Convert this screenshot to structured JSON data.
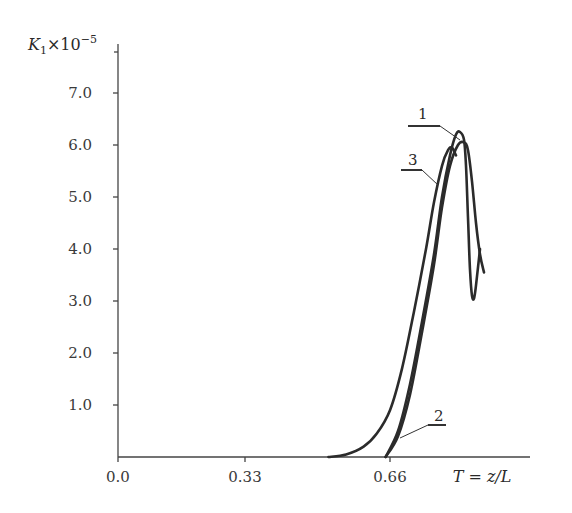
{
  "chart_data": {
    "type": "line",
    "title": "",
    "xlabel": "T = z/L",
    "ylabel": "K1×10^-5",
    "ylabel_parts": {
      "base": "K",
      "sub": "1",
      "mult": "×10",
      "sup": "−5"
    },
    "xlim": [
      0.0,
      0.99
    ],
    "ylim": [
      0.0,
      7.5
    ],
    "x_ticks": [
      "0.0",
      "0.33",
      "0.66"
    ],
    "y_ticks": [
      "1.0",
      "2.0",
      "3.0",
      "4.0",
      "5.0",
      "6.0",
      "7.0"
    ],
    "grid": false,
    "legend": "inline labels 1, 2, 3 with leader lines",
    "series": [
      {
        "name": "1",
        "points": [
          [
            0.65,
            0.0
          ],
          [
            0.68,
            0.5
          ],
          [
            0.71,
            1.4
          ],
          [
            0.74,
            2.6
          ],
          [
            0.77,
            3.9
          ],
          [
            0.79,
            5.0
          ],
          [
            0.81,
            5.8
          ],
          [
            0.825,
            6.2
          ],
          [
            0.835,
            6.25
          ],
          [
            0.845,
            6.1
          ],
          [
            0.85,
            5.6
          ],
          [
            0.855,
            4.6
          ],
          [
            0.86,
            3.6
          ],
          [
            0.865,
            3.1
          ],
          [
            0.87,
            3.05
          ],
          [
            0.875,
            3.3
          ],
          [
            0.885,
            4.0
          ]
        ]
      },
      {
        "name": "2",
        "points": [
          [
            0.65,
            0.0
          ],
          [
            0.68,
            0.4
          ],
          [
            0.71,
            1.2
          ],
          [
            0.74,
            2.4
          ],
          [
            0.77,
            3.7
          ],
          [
            0.79,
            4.8
          ],
          [
            0.81,
            5.6
          ],
          [
            0.83,
            6.0
          ],
          [
            0.845,
            6.05
          ],
          [
            0.855,
            5.9
          ],
          [
            0.865,
            5.3
          ],
          [
            0.875,
            4.5
          ],
          [
            0.885,
            3.9
          ],
          [
            0.895,
            3.55
          ]
        ]
      },
      {
        "name": "3",
        "points": [
          [
            0.52,
            0.0
          ],
          [
            0.56,
            0.05
          ],
          [
            0.6,
            0.2
          ],
          [
            0.63,
            0.45
          ],
          [
            0.66,
            0.9
          ],
          [
            0.69,
            1.7
          ],
          [
            0.72,
            2.8
          ],
          [
            0.75,
            4.0
          ],
          [
            0.77,
            4.9
          ],
          [
            0.79,
            5.6
          ],
          [
            0.805,
            5.9
          ],
          [
            0.815,
            5.95
          ],
          [
            0.825,
            5.8
          ]
        ]
      }
    ],
    "annotations": [
      {
        "text": "1",
        "target_series": "1"
      },
      {
        "text": "2",
        "target_series": "2"
      },
      {
        "text": "3",
        "target_series": "3"
      }
    ]
  }
}
